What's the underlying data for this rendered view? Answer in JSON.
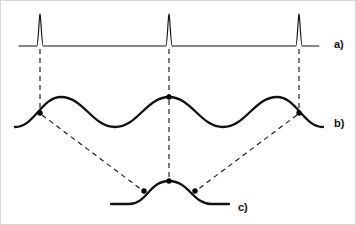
{
  "figure": {
    "title": "",
    "background_color": "#ffffff",
    "ink_color": "#111111",
    "accent_color": "#000000",
    "width": 356,
    "height": 225
  },
  "labels": {
    "trace_a": "a)",
    "trace_b": "b)",
    "trace_c": "c)"
  },
  "chart_data": {
    "type": "line",
    "title": "",
    "xlabel": "",
    "ylabel": "",
    "grid": false,
    "legend": "none",
    "axis_visible": false,
    "xlim": [
      0,
      356
    ],
    "ylim": [
      0,
      225
    ],
    "series": [
      {
        "name": "a)",
        "label": "a)",
        "description": "flat baseline with three narrow impulse spikes",
        "baseline_y": 45,
        "peak_y": 13,
        "x_start": 18,
        "x_end": 318,
        "stroke_width": 1.15,
        "spike_x": [
          39,
          168,
          298
        ],
        "spike_half_width": 3.2,
        "values": [
          0,
          0,
          1,
          0,
          0,
          1,
          0,
          0,
          1,
          0,
          0
        ]
      },
      {
        "name": "b)",
        "label": "b)",
        "description": "periodic smooth wave; marked nodes at the impulse abscissas",
        "x_start": 14,
        "x_end": 322,
        "crest_y": 96,
        "trough_y": 126,
        "stroke_width": 2.3,
        "node_points": [
          {
            "x": 39,
            "y": 112
          },
          {
            "x": 168,
            "y": 96
          },
          {
            "x": 298,
            "y": 112
          }
        ],
        "crest_x": [
          60,
          168,
          276
        ],
        "trough_x": [
          114,
          222
        ]
      },
      {
        "name": "c)",
        "label": "c)",
        "description": "single isolated bump; marked nodes on both flanks and apex",
        "x_start": 110,
        "x_end": 228,
        "crest_y": 180,
        "baseline_y": 203,
        "stroke_width": 2.3,
        "node_points": [
          {
            "x": 143,
            "y": 190
          },
          {
            "x": 168,
            "y": 180
          },
          {
            "x": 194,
            "y": 190
          }
        ],
        "crest_x": [
          168
        ]
      }
    ],
    "annotations": [
      {
        "type": "vertical-dashed",
        "x": 39,
        "y1": 48,
        "y2": 110,
        "from": "a)",
        "to": "b)"
      },
      {
        "type": "vertical-dashed",
        "x": 168,
        "y1": 48,
        "y2": 94,
        "from": "a)",
        "to": "b)"
      },
      {
        "type": "vertical-dashed",
        "x": 298,
        "y1": 48,
        "y2": 110,
        "from": "a)",
        "to": "b)"
      },
      {
        "type": "vertical-dashed",
        "x": 168,
        "y1": 99,
        "y2": 178,
        "from": "b)",
        "to": "c)"
      },
      {
        "type": "diagonal-dashed",
        "x1": 41,
        "y1": 114,
        "x2": 141,
        "y2": 189,
        "from": "b)",
        "to": "c)"
      },
      {
        "type": "diagonal-dashed",
        "x1": 296,
        "y1": 114,
        "x2": 196,
        "y2": 189,
        "from": "b)",
        "to": "c)"
      }
    ],
    "label_positions": [
      {
        "label": "a)",
        "x": 333,
        "y": 44
      },
      {
        "label": "b)",
        "x": 333,
        "y": 123
      },
      {
        "label": "c)",
        "x": 237,
        "y": 207
      }
    ]
  }
}
